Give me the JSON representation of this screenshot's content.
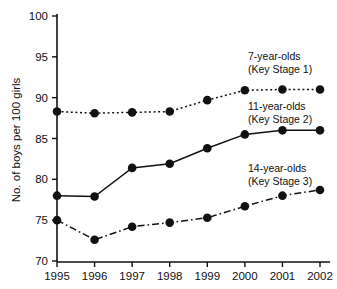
{
  "chart_data": {
    "type": "line",
    "title": "",
    "xlabel": "",
    "ylabel": "No. of boys per 100 girls",
    "x": [
      1995,
      1996,
      1997,
      1998,
      1999,
      2000,
      2001,
      2002
    ],
    "xtick_labels": [
      "1995",
      "1996",
      "1997",
      "1998",
      "1999",
      "2000",
      "2001",
      "2002"
    ],
    "ytick_labels": [
      "70",
      "75",
      "80",
      "85",
      "90",
      "95",
      "100"
    ],
    "yticks": [
      70,
      75,
      80,
      85,
      90,
      95,
      100
    ],
    "ylim": [
      70,
      100
    ],
    "grid": false,
    "legend_position": "inline-right",
    "series": [
      {
        "name": "7-year-olds",
        "sublabel": "(Key Stage 1)",
        "linestyle": "dotted",
        "color": "#111111",
        "values": [
          88.3,
          88.1,
          88.2,
          88.3,
          89.7,
          90.9,
          91.0,
          91.0
        ]
      },
      {
        "name": "11-year-olds",
        "sublabel": "(Key Stage 2)",
        "linestyle": "solid",
        "color": "#111111",
        "values": [
          78.0,
          77.9,
          81.4,
          81.9,
          83.8,
          85.5,
          86.0,
          86.0
        ]
      },
      {
        "name": "14-year-olds",
        "sublabel": "(Key Stage 3)",
        "linestyle": "dashdot",
        "color": "#111111",
        "values": [
          75.0,
          72.6,
          74.2,
          74.7,
          75.3,
          76.7,
          78.0,
          78.7
        ]
      }
    ],
    "annotations": [
      {
        "text": "7-year-olds",
        "sub": "(Key Stage 1)"
      },
      {
        "text": "11-year-olds",
        "sub": "(Key Stage 2)"
      },
      {
        "text": "14-year-olds",
        "sub": "(Key Stage 3)"
      }
    ]
  }
}
